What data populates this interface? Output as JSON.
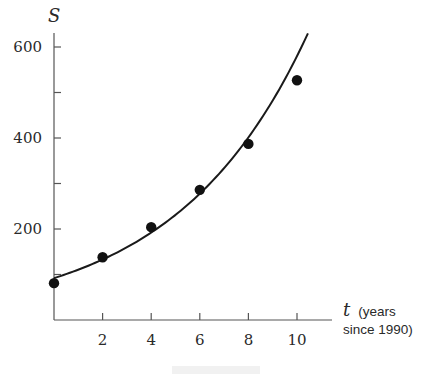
{
  "chart_data": {
    "type": "scatter",
    "title": "",
    "xlabel": "t (years since 1990)",
    "xlabel_var": "t",
    "xlabel_unit_line1": "(years",
    "xlabel_unit_line2": "since 1990)",
    "ylabel": "S",
    "xlim": [
      0,
      11
    ],
    "ylim": [
      0,
      650
    ],
    "x_ticks": [
      2,
      4,
      6,
      8,
      10
    ],
    "x_tick_labels": [
      "2",
      "4",
      "6",
      "8",
      "10"
    ],
    "y_ticks": [
      100,
      200,
      300,
      400,
      500,
      600
    ],
    "y_tick_labels": [
      "200",
      "400",
      "600"
    ],
    "y_labeled_ticks": [
      200,
      400,
      600
    ],
    "grid": false,
    "legend": null,
    "series": [
      {
        "name": "data",
        "kind": "scatter",
        "x": [
          0,
          2,
          4,
          6,
          8,
          10
        ],
        "y": [
          81,
          138,
          204,
          286,
          387,
          527
        ]
      },
      {
        "name": "fitted exponential curve",
        "kind": "line",
        "model": "S = 92 * e^(0.184 t)",
        "x_range": [
          0,
          10.45
        ],
        "y_at_ends": [
          92,
          630
        ]
      }
    ]
  }
}
